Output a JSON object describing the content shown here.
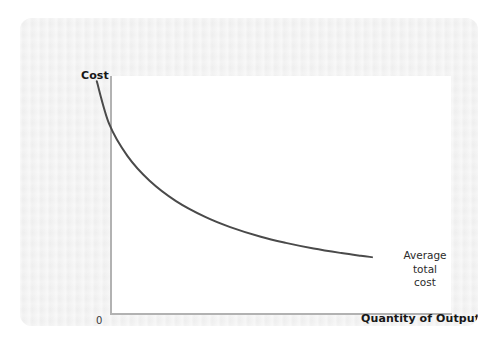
{
  "figure": {
    "background_color": "#ededed",
    "panel_color": "#ffffff",
    "axis_color": "#b2b2b2",
    "curve_color": "#4a4a4a"
  },
  "chart_data": {
    "type": "line",
    "title": "",
    "subtitle": "",
    "xlabel": "Quantity of Output",
    "ylabel": "Cost",
    "origin_label": "0",
    "grid": false,
    "legend_position": "inline-right",
    "xlim": [
      0,
      1
    ],
    "ylim": [
      0,
      1
    ],
    "axis_ticks": {
      "x": [],
      "y": []
    },
    "series": [
      {
        "name": "Average total cost",
        "label_lines": [
          "Average",
          "total",
          "cost"
        ],
        "color": "#4a4a4a",
        "style": "solid",
        "width": 2,
        "description": "Downward sloping convex curve falling steeply then flattening",
        "x": [
          0.01,
          0.055,
          0.12,
          0.2,
          0.295,
          0.4,
          0.49,
          0.6,
          0.69,
          0.79,
          0.89,
          0.96,
          1.0
        ],
        "y": [
          0.95,
          0.76,
          0.62,
          0.51,
          0.42,
          0.35,
          0.305,
          0.262,
          0.235,
          0.21,
          0.19,
          0.178,
          0.172
        ]
      }
    ],
    "annotations": [
      {
        "name": "average-total-cost-callout",
        "text": "Average total cost",
        "attached_to": "Average total cost",
        "position": "right-end-of-curve"
      }
    ]
  }
}
